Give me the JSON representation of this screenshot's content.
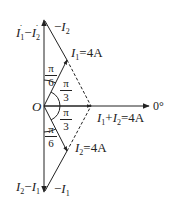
{
  "diagram": {
    "type": "phasor-diagram",
    "origin_label": "O",
    "reference_label": "0°",
    "phasors": [
      {
        "id": "I1",
        "name": "I",
        "sub": "1",
        "value_label": "=4A",
        "angle": "π/3 above reference"
      },
      {
        "id": "I2",
        "name": "I",
        "sub": "2",
        "value_label": "=4A",
        "angle": "π/3 below reference"
      },
      {
        "id": "sum",
        "name": "I",
        "sub": "1",
        "plus": "+",
        "name2": "I",
        "sub2": "2",
        "value_label": "=4A"
      },
      {
        "id": "negI2",
        "prefix": "−",
        "name": "I",
        "sub": "2"
      },
      {
        "id": "negI1",
        "prefix": "−",
        "name": "I",
        "sub": "1"
      },
      {
        "id": "diff12",
        "name": "I",
        "sub": "1",
        "minus": "−",
        "name2": "I",
        "sub2": "2"
      },
      {
        "id": "diff21",
        "name": "I",
        "sub": "2",
        "minus": "−",
        "name2": "I",
        "sub2": "1"
      }
    ],
    "angles": [
      {
        "num": "π",
        "den": "6"
      },
      {
        "num": "π",
        "den": "3"
      },
      {
        "num": "π",
        "den": "3"
      },
      {
        "num": "π",
        "den": "6"
      }
    ],
    "colors": {
      "stroke": "#222222",
      "background": "#ffffff"
    }
  }
}
